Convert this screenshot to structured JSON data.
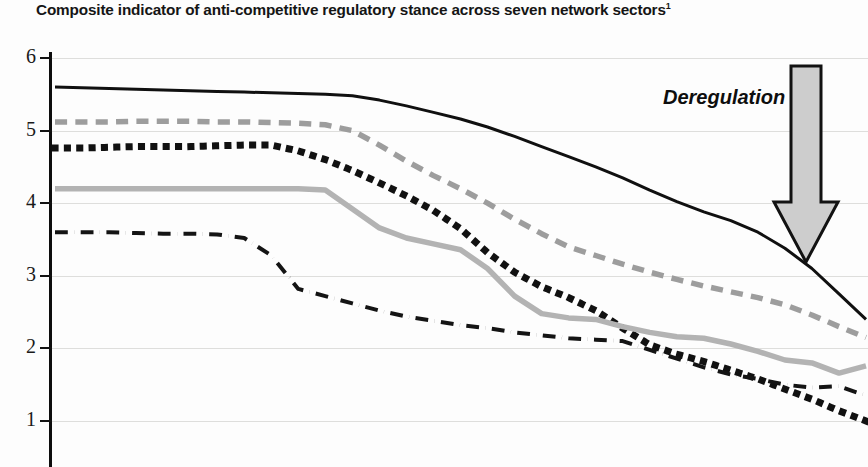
{
  "chart": {
    "title": "Composite indicator of anti-competitive regulatory stance across seven network sectors",
    "title_footnote_marker": "1"
  },
  "annotation": {
    "deregulation_label": "Deregulation",
    "arrow_icon": "arrow-down-icon",
    "arrow_fill": "#cdcdcd",
    "arrow_stroke": "#121212"
  },
  "axis": {
    "y_tick_labels": [
      "6",
      "5",
      "4",
      "3",
      "2",
      "1"
    ],
    "y_tick_values": [
      6,
      5,
      4,
      3,
      2,
      1
    ]
  },
  "chart_data": {
    "type": "line",
    "title": "Composite indicator of anti-competitive regulatory stance across seven network sectors",
    "xlabel": "",
    "ylabel": "",
    "ylim": [
      0.6,
      6.0
    ],
    "xlim": [
      0,
      30
    ],
    "grid": true,
    "legend_position": "none",
    "x": [
      0,
      1,
      2,
      3,
      4,
      5,
      6,
      7,
      8,
      9,
      10,
      11,
      12,
      13,
      14,
      15,
      16,
      17,
      18,
      19,
      20,
      21,
      22,
      23,
      24,
      25,
      26,
      27,
      28,
      29,
      30
    ],
    "series": [
      {
        "name": "series-solid-black",
        "style": "solid",
        "color": "#101010",
        "width": 3.0,
        "values": [
          5.6,
          5.59,
          5.58,
          5.57,
          5.56,
          5.55,
          5.54,
          5.53,
          5.52,
          5.51,
          5.5,
          5.48,
          5.42,
          5.34,
          5.25,
          5.16,
          5.05,
          4.92,
          4.78,
          4.64,
          4.5,
          4.35,
          4.18,
          4.02,
          3.88,
          3.76,
          3.6,
          3.38,
          3.1,
          2.75,
          2.4
        ]
      },
      {
        "name": "series-dashed-grey",
        "style": "dashed",
        "color": "#9d9d9d",
        "width": 5.5,
        "values": [
          5.12,
          5.12,
          5.12,
          5.13,
          5.13,
          5.13,
          5.12,
          5.12,
          5.11,
          5.1,
          5.08,
          5.0,
          4.8,
          4.58,
          4.38,
          4.2,
          4.0,
          3.78,
          3.58,
          3.4,
          3.28,
          3.16,
          3.05,
          2.95,
          2.86,
          2.78,
          2.7,
          2.6,
          2.46,
          2.3,
          2.15
        ]
      },
      {
        "name": "series-dotted-black",
        "style": "dotted",
        "color": "#111111",
        "width": 7.0,
        "values": [
          4.76,
          4.76,
          4.77,
          4.78,
          4.78,
          4.78,
          4.79,
          4.8,
          4.8,
          4.72,
          4.6,
          4.45,
          4.28,
          4.1,
          3.9,
          3.65,
          3.32,
          3.05,
          2.85,
          2.7,
          2.52,
          2.28,
          2.05,
          1.92,
          1.82,
          1.7,
          1.58,
          1.44,
          1.3,
          1.14,
          1.0
        ]
      },
      {
        "name": "series-solid-grey",
        "style": "solid",
        "color": "#b3b3b3",
        "width": 5.5,
        "values": [
          4.2,
          4.2,
          4.2,
          4.2,
          4.2,
          4.2,
          4.2,
          4.2,
          4.2,
          4.2,
          4.18,
          3.92,
          3.66,
          3.52,
          3.44,
          3.36,
          3.1,
          2.72,
          2.48,
          2.42,
          2.4,
          2.3,
          2.22,
          2.16,
          2.14,
          2.06,
          1.96,
          1.84,
          1.8,
          1.66,
          1.76
        ]
      },
      {
        "name": "series-dashdot-black",
        "style": "dashdot",
        "color": "#141414",
        "width": 4.0,
        "values": [
          3.6,
          3.6,
          3.6,
          3.59,
          3.58,
          3.58,
          3.57,
          3.52,
          3.28,
          2.82,
          2.72,
          2.62,
          2.52,
          2.44,
          2.38,
          2.32,
          2.28,
          2.22,
          2.18,
          2.14,
          2.12,
          2.1,
          1.98,
          1.86,
          1.74,
          1.64,
          1.58,
          1.5,
          1.46,
          1.48,
          1.35
        ]
      }
    ]
  }
}
